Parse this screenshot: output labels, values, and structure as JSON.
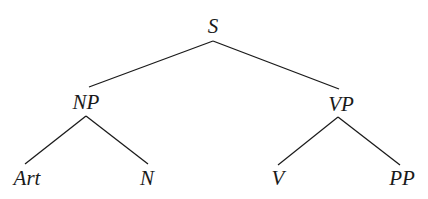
{
  "diagram": {
    "type": "syntax-tree",
    "nodes": {
      "root": {
        "label": "S",
        "x": 213,
        "y": 16
      },
      "np": {
        "label": "NP",
        "x": 86,
        "y": 92
      },
      "vp": {
        "label": "VP",
        "x": 341,
        "y": 94
      },
      "art": {
        "label": "Art",
        "x": 27,
        "y": 168
      },
      "n": {
        "label": "N",
        "x": 147,
        "y": 168
      },
      "v": {
        "label": "V",
        "x": 278,
        "y": 168
      },
      "pp": {
        "label": "PP",
        "x": 402,
        "y": 168
      }
    },
    "edges": [
      {
        "from": "S",
        "to": "NP",
        "x1": 213,
        "y1": 41,
        "x2": 89,
        "y2": 87
      },
      {
        "from": "S",
        "to": "VP",
        "x1": 213,
        "y1": 41,
        "x2": 339,
        "y2": 89
      },
      {
        "from": "NP",
        "to": "Art",
        "x1": 86,
        "y1": 116,
        "x2": 25,
        "y2": 164
      },
      {
        "from": "NP",
        "to": "N",
        "x1": 86,
        "y1": 116,
        "x2": 148,
        "y2": 164
      },
      {
        "from": "VP",
        "to": "V",
        "x1": 338,
        "y1": 117,
        "x2": 278,
        "y2": 165
      },
      {
        "from": "VP",
        "to": "PP",
        "x1": 338,
        "y1": 117,
        "x2": 400,
        "y2": 165
      }
    ],
    "line_color": "#1a1a1a",
    "background": "#ffffff"
  }
}
